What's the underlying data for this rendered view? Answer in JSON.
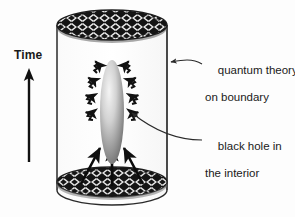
{
  "figure": {
    "background_color": "#fdfdfd",
    "ink_color": "#1a1a1a"
  },
  "axis": {
    "time_label": "Time",
    "direction": "up",
    "arrow_name": "time-arrow"
  },
  "annotations": [
    {
      "id": "quantum-theory",
      "line1": "quantum theory",
      "line2": "on boundary",
      "points_to": "cylinder-wall"
    },
    {
      "id": "black-hole",
      "line1": "black hole in",
      "line2": "the interior",
      "points_to": "black-hole-ellipse"
    }
  ],
  "objects": {
    "cylinder": {
      "name": "boundary-cylinder",
      "left_x": 57,
      "right_x": 167,
      "top_y": 25,
      "bottom_y": 190,
      "cap_ry": 15,
      "wall_color": "#2a2a2a",
      "body_color": "#fcfcfc"
    },
    "top_cap": {
      "name": "top-cap-tessellation",
      "pattern": "escher-tessellation",
      "fill_dark": "#141414",
      "fill_light": "#e8e8e8"
    },
    "bottom_cap": {
      "name": "bottom-cap-tessellation",
      "pattern": "escher-tessellation",
      "fill_dark": "#141414",
      "fill_light": "#e8e8e8"
    },
    "black_hole": {
      "name": "black-hole-ellipse",
      "center_x": 112,
      "center_y": 112,
      "rx": 12,
      "ry": 52,
      "gradient_light": "#f2f2f2",
      "gradient_dark": "#6e6e6e"
    },
    "radiation": {
      "name": "hawking-radiation-squiggles",
      "count": 8,
      "style": "zigzag-arrow",
      "color": "#111111"
    },
    "infalling": {
      "name": "infalling-matter-arrows",
      "count": 3,
      "style": "straight-arrow",
      "color": "#0b0b0b"
    }
  },
  "colors": {
    "ink": "#1a1a1a",
    "dark": "#141414",
    "light": "#e8e8e8",
    "paper": "#fdfdfd"
  }
}
